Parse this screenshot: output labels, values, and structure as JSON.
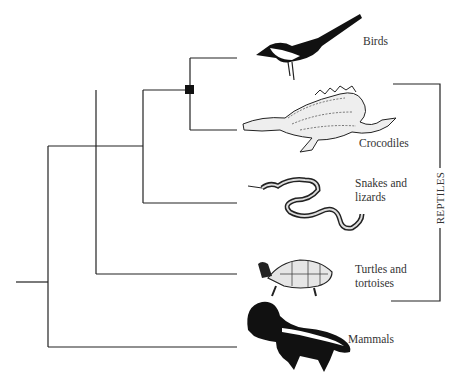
{
  "diagram": {
    "type": "cladogram",
    "taxa": [
      {
        "id": "birds",
        "label": "Birds",
        "icon": "magpie-bird-illustration"
      },
      {
        "id": "crocodiles",
        "label": "Crocodiles",
        "icon": "crocodile-illustration"
      },
      {
        "id": "snakes_lizards",
        "label_line1": "Snakes and",
        "label_line2": "lizards",
        "icon": "snake-illustration"
      },
      {
        "id": "turtles",
        "label_line1": "Turtles and",
        "label_line2": "tortoises",
        "icon": "turtle-illustration"
      },
      {
        "id": "mammals",
        "label": "Mammals",
        "icon": "skunk-illustration"
      }
    ],
    "bracket_label": "REPTILES",
    "node_marker": "filled-square",
    "colors": {
      "line": "#222222",
      "background": "#ffffff"
    }
  }
}
